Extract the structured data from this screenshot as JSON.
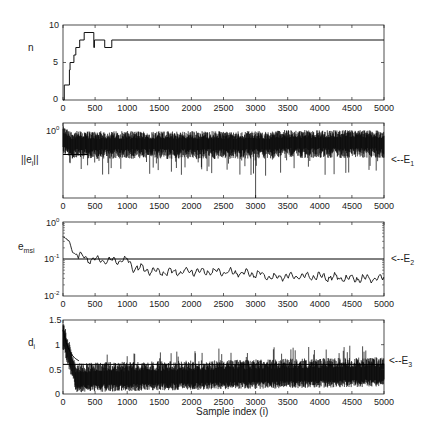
{
  "chart_data": [
    {
      "id": "n",
      "type": "line",
      "step": true,
      "ylabel": "n",
      "ylim": [
        0,
        10
      ],
      "yticks": [
        "0",
        "5",
        "10"
      ],
      "yscale": "linear",
      "xlim": [
        0,
        5000
      ],
      "xticks": [
        "0",
        "500",
        "1000",
        "1500",
        "2000",
        "2500",
        "3000",
        "3500",
        "4000",
        "4500",
        "5000"
      ],
      "x": [
        0,
        20,
        100,
        110,
        170,
        200,
        260,
        330,
        480,
        490,
        650,
        760,
        5000
      ],
      "values": [
        0,
        2,
        4,
        5,
        6,
        7,
        8,
        9,
        7,
        8,
        7,
        8,
        8
      ]
    },
    {
      "id": "norm_e",
      "type": "line",
      "ylabel": "||e_i||",
      "yscale": "log",
      "ytick_top": "10^0",
      "xlim": [
        0,
        5000
      ],
      "xticks": [
        "0",
        "500",
        "1000",
        "1500",
        "2000",
        "2500",
        "3000",
        "3500",
        "4000",
        "4500",
        "5000"
      ],
      "description": "Noisy error norm, dense band near 10^0 decreasing slightly; occasional deep downward spikes (largest at i≈3000)",
      "threshold_label": "<--E_1",
      "threshold_level_frac": 0.42
    },
    {
      "id": "e_msi",
      "type": "line",
      "ylabel": "e_msi",
      "yscale": "log",
      "ylim": [
        0.01,
        1
      ],
      "yticks": [
        "10^-2",
        "10^-1",
        "10^0"
      ],
      "xlim": [
        0,
        5000
      ],
      "xticks": [
        "0",
        "500",
        "1000",
        "1500",
        "2000",
        "2500",
        "3000",
        "3500",
        "4000",
        "4500",
        "5000"
      ],
      "x": [
        0,
        100,
        150,
        250,
        400,
        600,
        800,
        1000,
        1100,
        1500,
        2000,
        2500,
        3000,
        3300,
        3500,
        4000,
        4500,
        5000
      ],
      "values": [
        0.4,
        0.3,
        0.15,
        0.12,
        0.1,
        0.09,
        0.09,
        0.095,
        0.06,
        0.045,
        0.045,
        0.045,
        0.04,
        0.03,
        0.035,
        0.033,
        0.03,
        0.03
      ],
      "threshold_label": "<--E_2",
      "threshold_value": 0.1
    },
    {
      "id": "d",
      "type": "line",
      "ylabel": "d_i",
      "xlabel": "Sample index (i)",
      "ylim": [
        0,
        1.5
      ],
      "yticks": [
        "0",
        "0.5",
        "1",
        "1.5"
      ],
      "yscale": "linear",
      "xlim": [
        0,
        5000
      ],
      "xticks": [
        "0",
        "500",
        "1000",
        "1500",
        "2000",
        "2500",
        "3000",
        "3500",
        "4000",
        "4500",
        "5000"
      ],
      "description": "Noisy band starting ~1.3 decaying to ~0.35 mean by i≈200, band 0.05–0.7, slightly rising to ~0.45 mean near end",
      "threshold_label": "<--E_3",
      "threshold_value": 0.6
    }
  ],
  "labels": {
    "n": "n",
    "e_norm": "||e",
    "e_norm_sub": "i",
    "e_norm_end": "||",
    "emsi": "e",
    "emsi_sub": "msi",
    "d": "d",
    "d_sub": "i",
    "E1": "<--E",
    "E1_sub": "1",
    "E2": "<--E",
    "E2_sub": "2",
    "E3": "<--E",
    "E3_sub": "3",
    "xlabel": "Sample index (i)",
    "y_n": [
      "0",
      "5",
      "10"
    ],
    "y_d": [
      "0",
      "0.5",
      "1",
      "1.5"
    ],
    "pow_base": "10",
    "pow_0": "0",
    "pow_m1": "-1",
    "pow_m2": "-2"
  }
}
